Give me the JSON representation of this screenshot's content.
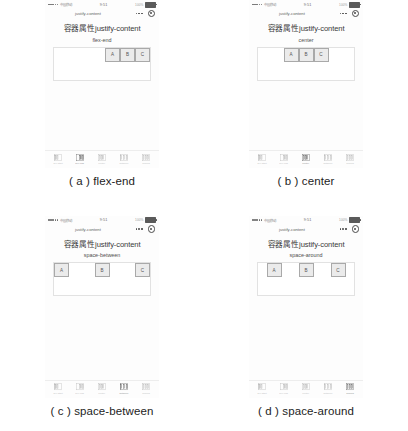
{
  "figure": {
    "panels": [
      {
        "id": "a",
        "caption": "( a ) flex-end",
        "justify_content": "flex-end",
        "statusbar": {
          "carrier": "中国移动",
          "time": "9:51",
          "battery_percent": "100%"
        },
        "navbar": {
          "title": "justify-content",
          "more_icon": "ellipsis-icon",
          "target_icon": "target-icon"
        },
        "page": {
          "title": "容器属性justify-content",
          "subtitle": "flex-end"
        },
        "items": [
          {
            "label": "A"
          },
          {
            "label": "B"
          },
          {
            "label": "C"
          }
        ],
        "tabbar": {
          "active_index": 1,
          "items": [
            {
              "label": "flex-start",
              "icon": "flex-start-icon"
            },
            {
              "label": "flex-end",
              "icon": "flex-end-icon"
            },
            {
              "label": "center",
              "icon": "center-icon"
            },
            {
              "label": "between",
              "icon": "space-between-icon"
            },
            {
              "label": "around",
              "icon": "space-around-icon"
            }
          ]
        }
      },
      {
        "id": "b",
        "caption": "( b ) center",
        "justify_content": "center",
        "statusbar": {
          "carrier": "中国移动",
          "time": "9:51",
          "battery_percent": "100%"
        },
        "navbar": {
          "title": "justify-content",
          "more_icon": "ellipsis-icon",
          "target_icon": "target-icon"
        },
        "page": {
          "title": "容器属性justify-content",
          "subtitle": "center"
        },
        "items": [
          {
            "label": "A"
          },
          {
            "label": "B"
          },
          {
            "label": "C"
          }
        ],
        "tabbar": {
          "active_index": 2,
          "items": [
            {
              "label": "flex-start",
              "icon": "flex-start-icon"
            },
            {
              "label": "flex-end",
              "icon": "flex-end-icon"
            },
            {
              "label": "center",
              "icon": "center-icon"
            },
            {
              "label": "between",
              "icon": "space-between-icon"
            },
            {
              "label": "around",
              "icon": "space-around-icon"
            }
          ]
        }
      },
      {
        "id": "c",
        "caption": "( c ) space-between",
        "justify_content": "space-between",
        "statusbar": {
          "carrier": "中国移动",
          "time": "9:51",
          "battery_percent": "100%"
        },
        "navbar": {
          "title": "justify-content",
          "more_icon": "ellipsis-icon",
          "target_icon": "target-icon"
        },
        "page": {
          "title": "容器属性justify-content",
          "subtitle": "space-between"
        },
        "items": [
          {
            "label": "A"
          },
          {
            "label": "B"
          },
          {
            "label": "C"
          }
        ],
        "tabbar": {
          "active_index": 3,
          "items": [
            {
              "label": "flex-start",
              "icon": "flex-start-icon"
            },
            {
              "label": "flex-end",
              "icon": "flex-end-icon"
            },
            {
              "label": "center",
              "icon": "center-icon"
            },
            {
              "label": "between",
              "icon": "space-between-icon"
            },
            {
              "label": "around",
              "icon": "space-around-icon"
            }
          ]
        }
      },
      {
        "id": "d",
        "caption": "( d ) space-around",
        "justify_content": "space-around",
        "statusbar": {
          "carrier": "中国移动",
          "time": "9:51",
          "battery_percent": "100%"
        },
        "navbar": {
          "title": "justify-content",
          "more_icon": "ellipsis-icon",
          "target_icon": "target-icon"
        },
        "page": {
          "title": "容器属性justify-content",
          "subtitle": "space-around"
        },
        "items": [
          {
            "label": "A"
          },
          {
            "label": "B"
          },
          {
            "label": "C"
          }
        ],
        "tabbar": {
          "active_index": 4,
          "items": [
            {
              "label": "flex-start",
              "icon": "flex-start-icon"
            },
            {
              "label": "flex-end",
              "icon": "flex-end-icon"
            },
            {
              "label": "center",
              "icon": "center-icon"
            },
            {
              "label": "between",
              "icon": "space-between-icon"
            },
            {
              "label": "around",
              "icon": "space-around-icon"
            }
          ]
        }
      }
    ]
  },
  "colors": {
    "background": "#ffffff",
    "item_fill": "#ebebeb",
    "item_border": "#a9a9a9",
    "container_border": "#e2e2e2",
    "caption_text": "#1d1d1d"
  }
}
